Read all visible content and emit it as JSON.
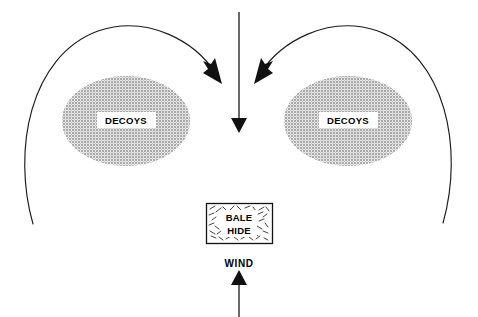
{
  "diagram": {
    "canvas": {
      "width": 478,
      "height": 317,
      "background": "#ffffff"
    },
    "colors": {
      "stroke": "#1a1a1a",
      "arrow_fill": "#111111",
      "decoy_fill": "#b5b5b5",
      "label_plate": "#ffffff",
      "background": "#ffffff"
    },
    "decoys": [
      {
        "id": "decoy-spread-left",
        "label": "DECOYS",
        "cx": 126,
        "cy": 121,
        "rx": 64,
        "ry": 45,
        "label_x": 126,
        "label_y": 121
      },
      {
        "id": "decoy-spread-right",
        "label": "DECOYS",
        "cx": 348,
        "cy": 121,
        "rx": 64,
        "ry": 45,
        "label_x": 348,
        "label_y": 121
      }
    ],
    "bale_hide": {
      "label_line_1": "BALE",
      "label_line_2": "HIDE",
      "x": 206,
      "y": 203,
      "width": 67,
      "height": 41
    },
    "wind": {
      "label": "WIND",
      "label_x": 239,
      "label_y": 266,
      "arrow_direction": "up",
      "arrow_from_y": 317,
      "arrow_to_y": 270,
      "arrow_x": 239
    },
    "center_arrow": {
      "direction": "down",
      "from_y": 12,
      "to_y": 133,
      "x": 239
    },
    "flight_arcs": [
      {
        "id": "flight-arc-left",
        "path": "M 33 224 C 12 150 30 56 98 31 C 148 14 196 42 216 74",
        "arrowhead_tip": [
          221,
          83
        ],
        "arrowhead_angle_deg": 58
      },
      {
        "id": "flight-arc-right",
        "path": "M 443 223 C 464 149 446 56 378 31 C 328 14 280 42 260 74",
        "arrowhead_tip": [
          255,
          83
        ],
        "arrowhead_angle_deg": 122
      }
    ]
  }
}
